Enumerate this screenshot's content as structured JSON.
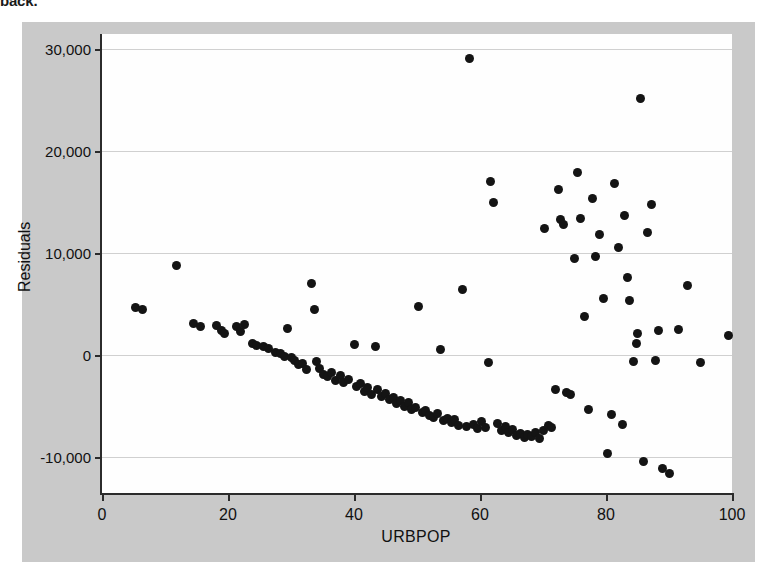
{
  "page": {
    "cropped_top_text": "back."
  },
  "figure": {
    "background_color": "#c9c9c9",
    "plot_background_color": "#fefefe",
    "point_color": "#141414",
    "gridline_color": "#d0d0d0",
    "axis_color": "#2b2b2b"
  },
  "chart_data": {
    "type": "scatter",
    "title": "",
    "xlabel": "URBPOP",
    "ylabel": "Residuals",
    "xlim": [
      0,
      100
    ],
    "ylim": [
      -13500,
      31500
    ],
    "xticks": [
      0,
      20,
      40,
      60,
      80,
      100
    ],
    "xticklabels": [
      "0",
      "20",
      "40",
      "60",
      "80",
      "100"
    ],
    "yticks": [
      -10000,
      0,
      10000,
      20000,
      30000
    ],
    "yticklabels": [
      "-10,000",
      "0",
      "10,000",
      "20,000",
      "30,000"
    ],
    "grid": "horizontal",
    "legend": null,
    "marker": "circle",
    "points": [
      [
        5.3,
        4700
      ],
      [
        6.4,
        4500
      ],
      [
        11.8,
        8800
      ],
      [
        14.6,
        3100
      ],
      [
        15.6,
        2800
      ],
      [
        18.2,
        2900
      ],
      [
        19.0,
        2400
      ],
      [
        19.4,
        2100
      ],
      [
        21.3,
        2800
      ],
      [
        22.0,
        2300
      ],
      [
        22.6,
        3000
      ],
      [
        23.9,
        1200
      ],
      [
        24.6,
        1000
      ],
      [
        25.6,
        900
      ],
      [
        26.4,
        700
      ],
      [
        27.5,
        300
      ],
      [
        28.3,
        200
      ],
      [
        28.9,
        -100
      ],
      [
        29.5,
        2600
      ],
      [
        30.1,
        -200
      ],
      [
        30.6,
        -500
      ],
      [
        31.2,
        -900
      ],
      [
        31.8,
        -800
      ],
      [
        32.4,
        -1400
      ],
      [
        33.2,
        7000
      ],
      [
        33.8,
        4500
      ],
      [
        34.0,
        -600
      ],
      [
        34.6,
        -1300
      ],
      [
        35.1,
        -1900
      ],
      [
        35.8,
        -2100
      ],
      [
        36.5,
        -1700
      ],
      [
        37.0,
        -2500
      ],
      [
        37.8,
        -2000
      ],
      [
        38.4,
        -2700
      ],
      [
        39.1,
        -2400
      ],
      [
        40.0,
        1100
      ],
      [
        40.4,
        -3100
      ],
      [
        41.0,
        -2800
      ],
      [
        41.6,
        -3500
      ],
      [
        42.2,
        -3200
      ],
      [
        42.8,
        -3800
      ],
      [
        43.4,
        900
      ],
      [
        43.8,
        -3400
      ],
      [
        44.4,
        -4000
      ],
      [
        45.0,
        -3700
      ],
      [
        45.6,
        -4300
      ],
      [
        46.2,
        -4100
      ],
      [
        46.8,
        -4700
      ],
      [
        47.4,
        -4400
      ],
      [
        48.0,
        -5000
      ],
      [
        48.6,
        -4600
      ],
      [
        49.2,
        -5300
      ],
      [
        49.8,
        -5100
      ],
      [
        50.2,
        4800
      ],
      [
        50.8,
        -5600
      ],
      [
        51.4,
        -5400
      ],
      [
        52.0,
        -5900
      ],
      [
        52.6,
        -6100
      ],
      [
        53.2,
        -5700
      ],
      [
        53.8,
        600
      ],
      [
        54.2,
        -6400
      ],
      [
        54.8,
        -6200
      ],
      [
        55.4,
        -6600
      ],
      [
        56.0,
        -6300
      ],
      [
        56.6,
        -6900
      ],
      [
        57.2,
        6500
      ],
      [
        57.8,
        -7000
      ],
      [
        58.4,
        29100
      ],
      [
        59.0,
        -6800
      ],
      [
        59.6,
        -7200
      ],
      [
        60.2,
        -6500
      ],
      [
        60.8,
        -7100
      ],
      [
        61.4,
        -700
      ],
      [
        61.6,
        17000
      ],
      [
        62.2,
        15000
      ],
      [
        62.8,
        -6700
      ],
      [
        63.4,
        -7400
      ],
      [
        64.0,
        -7000
      ],
      [
        64.6,
        -7600
      ],
      [
        65.2,
        -7300
      ],
      [
        65.8,
        -7900
      ],
      [
        66.4,
        -7700
      ],
      [
        67.0,
        -8100
      ],
      [
        67.6,
        -7800
      ],
      [
        68.2,
        -8000
      ],
      [
        68.8,
        -7600
      ],
      [
        69.4,
        -8200
      ],
      [
        70.0,
        -7400
      ],
      [
        70.2,
        12400
      ],
      [
        70.8,
        -6900
      ],
      [
        71.4,
        -7100
      ],
      [
        72.0,
        -3400
      ],
      [
        72.4,
        16300
      ],
      [
        72.8,
        13300
      ],
      [
        73.2,
        12800
      ],
      [
        73.8,
        -3600
      ],
      [
        74.4,
        -3800
      ],
      [
        75.0,
        9500
      ],
      [
        75.4,
        17900
      ],
      [
        76.0,
        13400
      ],
      [
        76.6,
        3800
      ],
      [
        77.2,
        -5300
      ],
      [
        77.8,
        15400
      ],
      [
        78.4,
        9700
      ],
      [
        79.0,
        11800
      ],
      [
        79.6,
        5600
      ],
      [
        80.2,
        -9600
      ],
      [
        80.8,
        -5800
      ],
      [
        81.4,
        16800
      ],
      [
        82.0,
        10600
      ],
      [
        82.6,
        -6800
      ],
      [
        83.0,
        13700
      ],
      [
        83.4,
        7600
      ],
      [
        83.8,
        5400
      ],
      [
        84.4,
        -600
      ],
      [
        84.8,
        1200
      ],
      [
        85.0,
        2100
      ],
      [
        85.5,
        25200
      ],
      [
        86.0,
        -10400
      ],
      [
        86.6,
        12000
      ],
      [
        87.2,
        14800
      ],
      [
        87.8,
        -500
      ],
      [
        88.4,
        2400
      ],
      [
        89.0,
        -11100
      ],
      [
        90.0,
        -11600
      ],
      [
        91.5,
        2500
      ],
      [
        93.0,
        6800
      ],
      [
        95.0,
        -700
      ],
      [
        99.5,
        1900
      ]
    ]
  }
}
